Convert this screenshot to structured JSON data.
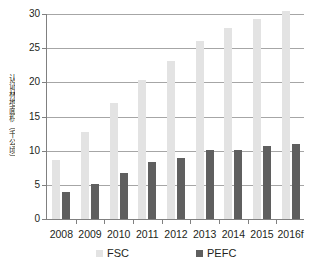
{
  "chart_data": {
    "type": "bar",
    "title": "",
    "subtitle": "",
    "xlabel": "",
    "ylabel": "认证林地面积（千公顷）",
    "categories": [
      "2008",
      "2009",
      "2010",
      "2011",
      "2012",
      "2013",
      "2014",
      "2015",
      "2016f"
    ],
    "series": [
      {
        "name": "FSC",
        "color": "#e3e3e3",
        "values": [
          8.6,
          12.7,
          17.0,
          20.3,
          23.1,
          26.0,
          28.0,
          29.2,
          30.5
        ]
      },
      {
        "name": "PEFC",
        "color": "#5f5f5f",
        "values": [
          3.9,
          5.1,
          6.8,
          8.3,
          9.0,
          10.1,
          10.1,
          10.7,
          11.0
        ]
      }
    ],
    "ylim": [
      0,
      30
    ],
    "yticks": [
      0,
      5,
      10,
      15,
      20,
      25,
      30
    ],
    "ytick_labels": [
      "0",
      "5",
      "10",
      "15",
      "20",
      "25",
      "30"
    ],
    "grid": true,
    "legend_position": "bottom"
  },
  "legend": {
    "items": [
      {
        "label": "FSC",
        "color": "#e3e3e3"
      },
      {
        "label": "PEFC",
        "color": "#5f5f5f"
      }
    ]
  },
  "colors": {
    "fsc": "#e3e3e3",
    "pefc": "#5f5f5f",
    "gridline": "#a6a6a6",
    "axis": "#808080",
    "text": "#231f20",
    "background": "#ffffff"
  }
}
